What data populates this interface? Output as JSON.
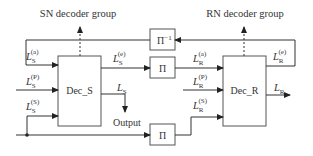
{
  "title_sn": "SN decoder group",
  "title_rn": "RN decoder group",
  "blocks": {
    "dec_s": "Dec_S",
    "dec_r": "Dec_R",
    "pi_inv": "Π",
    "pi_inv_sup": "−1",
    "pi_top": "Π",
    "pi_bottom": "Π"
  },
  "labels": {
    "ls_a": {
      "base": "L",
      "sub": "S",
      "sup": "(a)"
    },
    "ls_p": {
      "base": "L",
      "sub": "S",
      "sup": "(P)"
    },
    "ls_s": {
      "base": "L",
      "sub": "S",
      "sup": "(S)"
    },
    "ls_e": {
      "base": "L",
      "sub": "S",
      "sup": "(e)"
    },
    "ls": {
      "base": "L",
      "sub": "S"
    },
    "lr_a": {
      "base": "L",
      "sub": "R",
      "sup": "(a)"
    },
    "lr_p": {
      "base": "L",
      "sub": "R",
      "sup": "(P)"
    },
    "lr_s": {
      "base": "L",
      "sub": "R",
      "sup": "(S)"
    },
    "lr_e": {
      "base": "L",
      "sub": "R",
      "sup": "(e)"
    },
    "lr": {
      "base": "L",
      "sub": "R"
    },
    "output": "Output"
  },
  "colors": {
    "line": "#333333",
    "box": "#555555",
    "text": "#333333"
  }
}
